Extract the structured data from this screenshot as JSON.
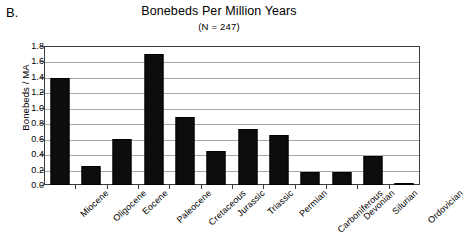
{
  "panel": {
    "label": "B."
  },
  "chart_data": {
    "type": "bar",
    "title": "Bonebeds Per Million Years",
    "subtitle": "(N = 247)",
    "xlabel": "",
    "ylabel": "Bonebeds / MA",
    "ylim": [
      0.0,
      1.8
    ],
    "ytick_labels": [
      "1.8",
      "1.6",
      "1.4",
      "1.2",
      "1.0",
      "0.8",
      "0.6",
      "0.4",
      "0.2",
      "0.0"
    ],
    "ytick_values": [
      1.8,
      1.6,
      1.4,
      1.2,
      1.0,
      0.8,
      0.6,
      0.4,
      0.2,
      0.0
    ],
    "grid": true,
    "legend": false,
    "bar_color": "#0d0d0d",
    "categories": [
      "Miocene",
      "Oligocene",
      "Eocene",
      "Paleocene",
      "Cretaceous",
      "Jurassic",
      "Triassic",
      "Permian",
      "Carboniferous",
      "Devonian",
      "Silurian",
      "Ordovician"
    ],
    "values": [
      1.39,
      0.25,
      0.6,
      1.7,
      0.88,
      0.44,
      0.72,
      0.65,
      0.17,
      0.17,
      0.38,
      0.02
    ]
  }
}
